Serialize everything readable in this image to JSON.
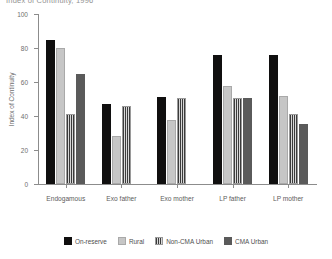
{
  "chart_data": {
    "type": "bar",
    "title": "Index of Continuity, 1996",
    "xlabel": "",
    "ylabel": "Index of Continuity",
    "ylim": [
      0,
      100
    ],
    "yticks": [
      0,
      20,
      40,
      60,
      80,
      100
    ],
    "grid": false,
    "legend_position": "bottom",
    "categories": [
      "Endogamous",
      "Exo father",
      "Exo mother",
      "LP father",
      "LP mother"
    ],
    "series": [
      {
        "name": "On-reserve",
        "color": "#100f0f",
        "values": [
          85,
          47,
          51,
          76,
          76
        ]
      },
      {
        "name": "Rural",
        "color": "#c6c6c6",
        "values": [
          80,
          28,
          37.5,
          57.5,
          52
        ]
      },
      {
        "name": "Non-CMA Urban",
        "color": "#3b3b3b",
        "values": [
          41,
          46,
          50.5,
          50.5,
          41
        ]
      },
      {
        "name": "CMA Urban",
        "color": "#5a5a5a",
        "values": [
          65,
          null,
          null,
          50.5,
          35.5
        ]
      }
    ]
  }
}
